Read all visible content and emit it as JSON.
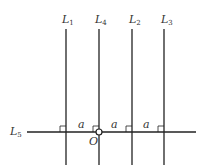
{
  "diagram": {
    "vertical_lines": [
      {
        "name": "L",
        "sub": "1",
        "x": 66
      },
      {
        "name": "L",
        "sub": "4",
        "x": 99
      },
      {
        "name": "L",
        "sub": "2",
        "x": 132
      },
      {
        "name": "L",
        "sub": "3",
        "x": 164
      }
    ],
    "horizontal_line": {
      "name": "L",
      "sub": "5",
      "y": 132
    },
    "origin_label": "O",
    "spacing_label": "a"
  }
}
